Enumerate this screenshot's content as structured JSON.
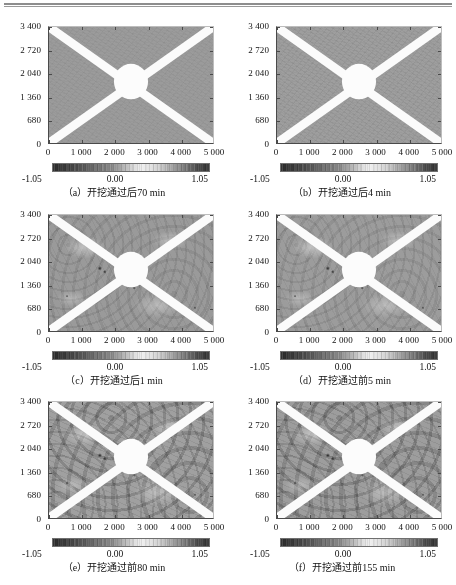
{
  "figure": {
    "axis": {
      "x_ticks": [
        "0",
        "1 000",
        "2 000",
        "3 000",
        "4 000",
        "5 000"
      ],
      "x_tick_values": [
        0,
        1000,
        2000,
        3000,
        4000,
        5000
      ],
      "y_ticks": [
        "0",
        "680",
        "1 360",
        "2 040",
        "2 720",
        "3 400"
      ],
      "y_tick_values": [
        0,
        680,
        1360,
        2040,
        2720,
        3400
      ],
      "xlim": [
        0,
        5000
      ],
      "ylim": [
        0,
        3400
      ]
    },
    "colorbar": {
      "min_label": "-1.05",
      "mid_label": "0.00",
      "max_label": "1.05",
      "min_value": -1.05,
      "mid_value": 0.0,
      "max_value": 1.05,
      "colormap": "grayscale-diverging",
      "dark_color": "#2b2b2b",
      "light_color": "#efefef"
    },
    "panels": [
      {
        "tag": "(a)",
        "caption": "（a）开挖通过后70 min",
        "texture": "smooth",
        "bg": "#9b9b9b"
      },
      {
        "tag": "(b)",
        "caption": "（b）开挖通过后4 min",
        "texture": "light",
        "bg": "#9e9e9e"
      },
      {
        "tag": "(c)",
        "caption": "（c）开挖通过后1 min",
        "texture": "medium",
        "bg": "#9a9a9a"
      },
      {
        "tag": "(d)",
        "caption": "（d）开挖通过前5 min",
        "texture": "medium",
        "bg": "#9c9c9c"
      },
      {
        "tag": "(e)",
        "caption": "（e）开挖通过前80 min",
        "texture": "rough",
        "bg": "#a0a0a0"
      },
      {
        "tag": "(f)",
        "caption": "（f）开挖通过前155 min",
        "texture": "rough",
        "bg": "#9d9d9d"
      }
    ]
  },
  "chart_data": {
    "type": "heatmap",
    "title": "",
    "xlabel": "",
    "ylabel": "",
    "xlim": [
      0,
      5000
    ],
    "ylim": [
      0,
      3400
    ],
    "xticks": [
      0,
      1000,
      2000,
      3000,
      4000,
      5000
    ],
    "yticks": [
      0,
      680,
      1360,
      2040,
      2720,
      3400
    ],
    "xticklabels": [
      "0",
      "1 000",
      "2 000",
      "3 000",
      "4 000",
      "5 000"
    ],
    "yticklabels": [
      "0",
      "680",
      "1 360",
      "2 040",
      "2 720",
      "3 400"
    ],
    "grid": false,
    "legend": "none",
    "colorbar": {
      "ticks": [
        -1.05,
        0.0,
        1.05
      ],
      "ticklabels": [
        "-1.05",
        "0.00",
        "1.05"
      ],
      "vmin": -1.05,
      "vmax": 1.05,
      "orientation": "horizontal",
      "position": "below-axes"
    },
    "panels": [
      {
        "label": "(a)",
        "caption": "（a）开挖通过后70 min",
        "background_value": 0.0,
        "band_value": 1.05,
        "disc_value": 1.05,
        "noise_amplitude": 0.05,
        "features": {
          "x_bands": [
            {
              "from": [
                0,
                0
              ],
              "to": [
                5000,
                3400
              ]
            },
            {
              "from": [
                0,
                3400
              ],
              "to": [
                5000,
                0
              ]
            }
          ],
          "band_width": 260,
          "disc": {
            "center": [
              2500,
              1800
            ],
            "radius": 520
          }
        }
      },
      {
        "label": "(b)",
        "caption": "（b）开挖通过后4 min",
        "background_value": 0.02,
        "band_value": 1.05,
        "disc_value": 1.05,
        "noise_amplitude": 0.12,
        "features": {
          "x_bands": [
            {
              "from": [
                0,
                0
              ],
              "to": [
                5000,
                3400
              ]
            },
            {
              "from": [
                0,
                3400
              ],
              "to": [
                5000,
                0
              ]
            }
          ],
          "band_width": 260,
          "disc": {
            "center": [
              2500,
              1800
            ],
            "radius": 520
          }
        }
      },
      {
        "label": "(c)",
        "caption": "（c）开挖通过后1 min",
        "background_value": -0.02,
        "band_value": 1.05,
        "disc_value": 1.05,
        "noise_amplitude": 0.2,
        "features": {
          "x_bands": [
            {
              "from": [
                0,
                0
              ],
              "to": [
                5000,
                3400
              ]
            },
            {
              "from": [
                0,
                3400
              ],
              "to": [
                5000,
                0
              ]
            }
          ],
          "band_width": 260,
          "disc": {
            "center": [
              2500,
              1800
            ],
            "radius": 520
          }
        }
      },
      {
        "label": "(d)",
        "caption": "（d）开挖通过前5 min",
        "background_value": 0.0,
        "band_value": 1.05,
        "disc_value": 1.05,
        "noise_amplitude": 0.22,
        "features": {
          "x_bands": [
            {
              "from": [
                0,
                0
              ],
              "to": [
                5000,
                3400
              ]
            },
            {
              "from": [
                0,
                3400
              ],
              "to": [
                5000,
                0
              ]
            }
          ],
          "band_width": 260,
          "disc": {
            "center": [
              2500,
              1800
            ],
            "radius": 520
          }
        }
      },
      {
        "label": "(e)",
        "caption": "（e）开挖通过前80 min",
        "background_value": 0.05,
        "band_value": 1.05,
        "disc_value": 1.05,
        "noise_amplitude": 0.35,
        "features": {
          "x_bands": [
            {
              "from": [
                0,
                0
              ],
              "to": [
                5000,
                3400
              ]
            },
            {
              "from": [
                0,
                3400
              ],
              "to": [
                5000,
                0
              ]
            }
          ],
          "band_width": 260,
          "disc": {
            "center": [
              2500,
              1800
            ],
            "radius": 520
          }
        }
      },
      {
        "label": "(f)",
        "caption": "（f）开挖通过前155 min",
        "background_value": 0.03,
        "band_value": 1.05,
        "disc_value": 1.05,
        "noise_amplitude": 0.38,
        "features": {
          "x_bands": [
            {
              "from": [
                0,
                0
              ],
              "to": [
                5000,
                3400
              ]
            },
            {
              "from": [
                0,
                3400
              ],
              "to": [
                5000,
                0
              ]
            }
          ],
          "band_width": 260,
          "disc": {
            "center": [
              2500,
              1800
            ],
            "radius": 520
          }
        }
      }
    ]
  }
}
